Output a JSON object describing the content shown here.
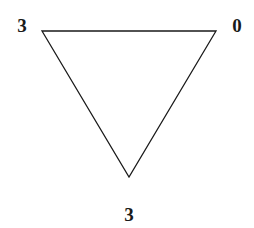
{
  "diagram": {
    "shape": "triangle",
    "orientation": "pointing-down",
    "vertices": [
      {
        "id": "top-left",
        "label": "3",
        "x": 42,
        "y": 31
      },
      {
        "id": "top-right",
        "label": "0",
        "x": 216,
        "y": 31
      },
      {
        "id": "bottom",
        "label": "3",
        "x": 129,
        "y": 177
      }
    ],
    "stroke_color": "#1a1a1a",
    "background": "#ffffff"
  }
}
